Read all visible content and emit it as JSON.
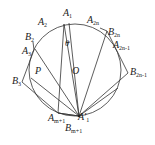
{
  "diagram": {
    "type": "geometry",
    "colors": {
      "stroke": "#333333",
      "background": "#ffffff"
    },
    "labels": {
      "A1": {
        "base": "A",
        "sub": "1"
      },
      "A2": {
        "base": "A",
        "sub": "2"
      },
      "A3": {
        "base": "A",
        "sub": "3"
      },
      "B2": {
        "base": "B",
        "sub": "2"
      },
      "B3": {
        "base": "B",
        "sub": "3"
      },
      "A2n": {
        "base": "A",
        "sub": "2n"
      },
      "B2n": {
        "base": "B",
        "sub": "2n"
      },
      "A2n1": {
        "base": "A",
        "sub": "2n-1"
      },
      "B2n1": {
        "base": "B",
        "sub": "2n-1"
      },
      "P": {
        "base": "P",
        "sub": ""
      },
      "O": {
        "base": "O",
        "sub": ""
      },
      "theta": {
        "base": "θ",
        "sub": ""
      },
      "Am1": {
        "base": "A",
        "sub": "m+1"
      },
      "Bm1": {
        "base": "B",
        "sub": "m+1"
      },
      "A1p": {
        "base": "A",
        "sub": "1",
        "prime": "′"
      }
    }
  }
}
